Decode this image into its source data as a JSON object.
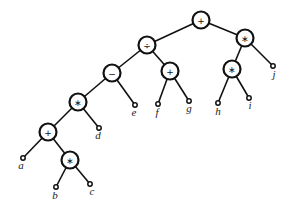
{
  "diagram": {
    "type": "expression-tree",
    "nodes": [
      {
        "id": "n1",
        "label": "+",
        "kind": "op",
        "x": 201,
        "y": 20
      },
      {
        "id": "n2",
        "label": "÷",
        "kind": "op",
        "x": 147,
        "y": 45
      },
      {
        "id": "n3",
        "label": "∗",
        "kind": "op",
        "x": 245,
        "y": 38
      },
      {
        "id": "n4",
        "label": "−",
        "kind": "op",
        "x": 112,
        "y": 73
      },
      {
        "id": "n5",
        "label": "+",
        "kind": "op",
        "x": 170,
        "y": 71
      },
      {
        "id": "n6",
        "label": "∗",
        "kind": "op",
        "x": 232,
        "y": 69
      },
      {
        "id": "n7",
        "label": "∗",
        "kind": "op",
        "x": 78,
        "y": 102
      },
      {
        "id": "n8",
        "label": "+",
        "kind": "op",
        "x": 48,
        "y": 132
      },
      {
        "id": "n9",
        "label": "∗",
        "kind": "op",
        "x": 70,
        "y": 160
      },
      {
        "id": "a",
        "label": "a",
        "kind": "leaf",
        "x": 23,
        "y": 158,
        "lx": 21,
        "ly": 169
      },
      {
        "id": "b",
        "label": "b",
        "kind": "leaf",
        "x": 56,
        "y": 187,
        "lx": 55,
        "ly": 199
      },
      {
        "id": "c",
        "label": "c",
        "kind": "leaf",
        "x": 90,
        "y": 184,
        "lx": 92,
        "ly": 195
      },
      {
        "id": "d",
        "label": "d",
        "kind": "leaf",
        "x": 99,
        "y": 128,
        "lx": 98,
        "ly": 139
      },
      {
        "id": "e",
        "label": "e",
        "kind": "leaf",
        "x": 135,
        "y": 105,
        "lx": 134,
        "ly": 116
      },
      {
        "id": "f",
        "label": "f",
        "kind": "leaf",
        "x": 158,
        "y": 104,
        "lx": 157,
        "ly": 116
      },
      {
        "id": "g",
        "label": "g",
        "kind": "leaf",
        "x": 189,
        "y": 101,
        "lx": 189,
        "ly": 112
      },
      {
        "id": "h",
        "label": "h",
        "kind": "leaf",
        "x": 218,
        "y": 103,
        "lx": 218,
        "ly": 115
      },
      {
        "id": "i",
        "label": "i",
        "kind": "leaf",
        "x": 249,
        "y": 98,
        "lx": 250,
        "ly": 109
      },
      {
        "id": "j",
        "label": "j",
        "kind": "leaf",
        "x": 273,
        "y": 66,
        "lx": 274,
        "ly": 78
      }
    ],
    "edges": [
      [
        "n1",
        "n2"
      ],
      [
        "n1",
        "n3"
      ],
      [
        "n2",
        "n4"
      ],
      [
        "n2",
        "n5"
      ],
      [
        "n3",
        "n6"
      ],
      [
        "n3",
        "j"
      ],
      [
        "n4",
        "n7"
      ],
      [
        "n4",
        "e"
      ],
      [
        "n5",
        "f"
      ],
      [
        "n5",
        "g"
      ],
      [
        "n6",
        "h"
      ],
      [
        "n6",
        "i"
      ],
      [
        "n7",
        "n8"
      ],
      [
        "n7",
        "d"
      ],
      [
        "n8",
        "a"
      ],
      [
        "n8",
        "n9"
      ],
      [
        "n9",
        "b"
      ],
      [
        "n9",
        "c"
      ]
    ]
  }
}
